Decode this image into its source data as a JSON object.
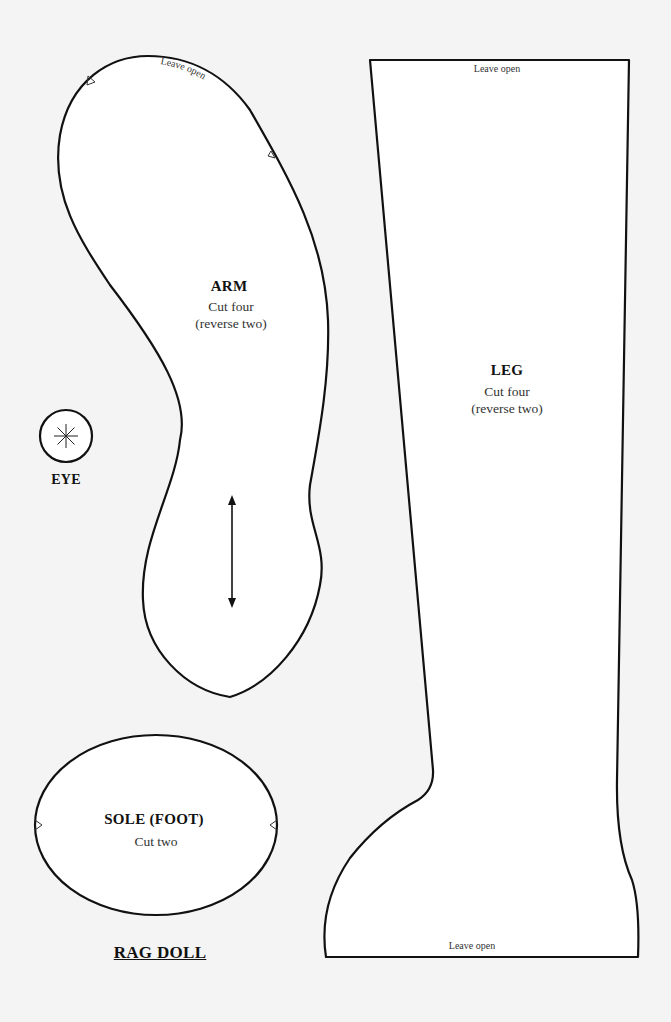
{
  "sheet": {
    "title": "RAG DOLL",
    "colors": {
      "background": "#f4f4f4",
      "piece_fill": "#ffffff",
      "outline": "#111111"
    }
  },
  "pieces": {
    "arm": {
      "name": "ARM",
      "cut": "Cut four",
      "note": "(reverse two)",
      "opening": "Leave open",
      "grainline": "double-arrow"
    },
    "leg": {
      "name": "LEG",
      "cut": "Cut four",
      "note": "(reverse two)",
      "opening_top": "Leave open",
      "opening_bottom": "Leave open"
    },
    "eye": {
      "name": "EYE",
      "icon": "asterisk-in-circle"
    },
    "sole": {
      "name": "SOLE (FOOT)",
      "cut": "Cut two"
    }
  }
}
